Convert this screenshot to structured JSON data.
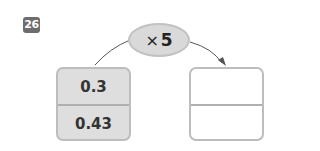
{
  "problem": {
    "number": "26"
  },
  "operator": {
    "symbol": "×",
    "value": "5"
  },
  "input_box": {
    "values": [
      "0.3",
      "0.43"
    ]
  },
  "output_box": {
    "values": [
      "",
      ""
    ]
  },
  "colors": {
    "badge": "#6d6d6d",
    "oval_fill": "#d9d9d9",
    "input_fill": "#dedede",
    "border": "#bdbdbd"
  }
}
